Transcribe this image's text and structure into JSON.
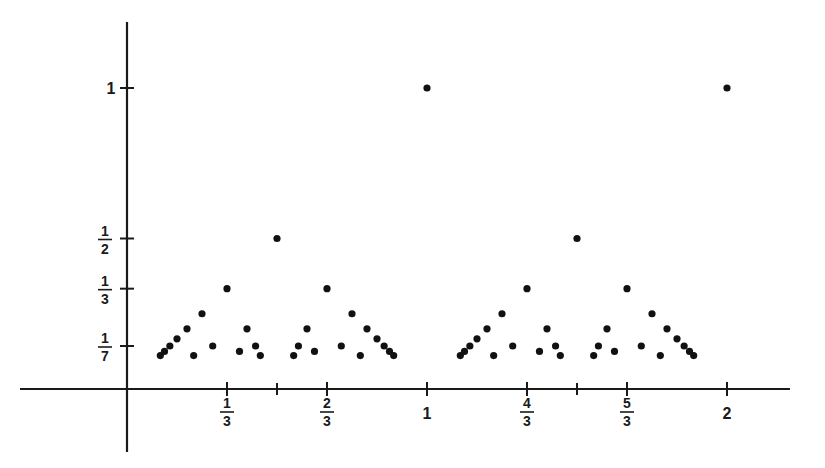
{
  "figure": {
    "title": "",
    "background_color": "#ffffff",
    "ink_color": "#1a1a1a",
    "dot_color": "#111111"
  },
  "geometry": {
    "origin_x_px": 127,
    "origin_y_px": 389,
    "px_per_unit_x": 300,
    "px_per_unit_y": 301,
    "dot_radius_px": 3.6,
    "x_axis_start_px": 20,
    "x_axis_end_px": 790,
    "y_axis_top_px": 22,
    "y_axis_bottom_px": 452,
    "tick_len_px": 7
  },
  "chart_data": {
    "type": "scatter",
    "title": "",
    "xlabel": "",
    "ylabel": "",
    "xlim": [
      -0.36,
      2.21
    ],
    "ylim": [
      -0.21,
      1.22
    ],
    "grid": false,
    "legend": null,
    "max_denominator": 9,
    "x_ticks": [
      {
        "value": 0.3333333333,
        "label": "1/3",
        "numerator": "1",
        "denominator": "3",
        "labeled": true
      },
      {
        "value": 0.5,
        "label": "",
        "labeled": false
      },
      {
        "value": 0.6666666667,
        "label": "2/3",
        "numerator": "2",
        "denominator": "3",
        "labeled": true
      },
      {
        "value": 1.0,
        "label": "1",
        "labeled": true
      },
      {
        "value": 1.3333333333,
        "label": "4/3",
        "numerator": "4",
        "denominator": "3",
        "labeled": true
      },
      {
        "value": 1.5,
        "label": "",
        "labeled": false
      },
      {
        "value": 1.6666666667,
        "label": "5/3",
        "numerator": "5",
        "denominator": "3",
        "labeled": true
      },
      {
        "value": 2.0,
        "label": "2",
        "labeled": true
      }
    ],
    "y_ticks": [
      {
        "value": 0.1428571429,
        "label": "1/7",
        "numerator": "1",
        "denominator": "7",
        "labeled": true
      },
      {
        "value": 0.3333333333,
        "label": "1/3",
        "numerator": "1",
        "denominator": "3",
        "labeled": true
      },
      {
        "value": 0.5,
        "label": "1/2",
        "numerator": "1",
        "denominator": "2",
        "labeled": true
      },
      {
        "value": 1.0,
        "label": "1",
        "labeled": true
      }
    ],
    "points": [
      {
        "x": 0.1111111111,
        "y": 0.1111111111
      },
      {
        "x": 0.125,
        "y": 0.125
      },
      {
        "x": 0.1428571429,
        "y": 0.1428571429
      },
      {
        "x": 0.1666666667,
        "y": 0.1666666667
      },
      {
        "x": 0.2,
        "y": 0.2
      },
      {
        "x": 0.2222222222,
        "y": 0.1111111111
      },
      {
        "x": 0.25,
        "y": 0.25
      },
      {
        "x": 0.2857142857,
        "y": 0.1428571429
      },
      {
        "x": 0.3333333333,
        "y": 0.3333333333
      },
      {
        "x": 0.375,
        "y": 0.125
      },
      {
        "x": 0.4,
        "y": 0.2
      },
      {
        "x": 0.4285714286,
        "y": 0.1428571429
      },
      {
        "x": 0.4444444444,
        "y": 0.1111111111
      },
      {
        "x": 0.5,
        "y": 0.5
      },
      {
        "x": 0.5555555556,
        "y": 0.1111111111
      },
      {
        "x": 0.5714285714,
        "y": 0.1428571429
      },
      {
        "x": 0.6,
        "y": 0.2
      },
      {
        "x": 0.625,
        "y": 0.125
      },
      {
        "x": 0.6666666667,
        "y": 0.3333333333
      },
      {
        "x": 0.7142857143,
        "y": 0.1428571429
      },
      {
        "x": 0.75,
        "y": 0.25
      },
      {
        "x": 0.7777777778,
        "y": 0.1111111111
      },
      {
        "x": 0.8,
        "y": 0.2
      },
      {
        "x": 0.8333333333,
        "y": 0.1666666667
      },
      {
        "x": 0.8571428571,
        "y": 0.1428571429
      },
      {
        "x": 0.875,
        "y": 0.125
      },
      {
        "x": 0.8888888889,
        "y": 0.1111111111
      },
      {
        "x": 1.0,
        "y": 1.0
      },
      {
        "x": 1.1111111111,
        "y": 0.1111111111
      },
      {
        "x": 1.125,
        "y": 0.125
      },
      {
        "x": 1.1428571429,
        "y": 0.1428571429
      },
      {
        "x": 1.1666666667,
        "y": 0.1666666667
      },
      {
        "x": 1.2,
        "y": 0.2
      },
      {
        "x": 1.2222222222,
        "y": 0.1111111111
      },
      {
        "x": 1.25,
        "y": 0.25
      },
      {
        "x": 1.2857142857,
        "y": 0.1428571429
      },
      {
        "x": 1.3333333333,
        "y": 0.3333333333
      },
      {
        "x": 1.375,
        "y": 0.125
      },
      {
        "x": 1.4,
        "y": 0.2
      },
      {
        "x": 1.4285714286,
        "y": 0.1428571429
      },
      {
        "x": 1.4444444444,
        "y": 0.1111111111
      },
      {
        "x": 1.5,
        "y": 0.5
      },
      {
        "x": 1.5555555556,
        "y": 0.1111111111
      },
      {
        "x": 1.5714285714,
        "y": 0.1428571429
      },
      {
        "x": 1.6,
        "y": 0.2
      },
      {
        "x": 1.625,
        "y": 0.125
      },
      {
        "x": 1.6666666667,
        "y": 0.3333333333
      },
      {
        "x": 1.7142857143,
        "y": 0.1428571429
      },
      {
        "x": 1.75,
        "y": 0.25
      },
      {
        "x": 1.7777777778,
        "y": 0.1111111111
      },
      {
        "x": 1.8,
        "y": 0.2
      },
      {
        "x": 1.8333333333,
        "y": 0.1666666667
      },
      {
        "x": 1.8571428571,
        "y": 0.1428571429
      },
      {
        "x": 1.875,
        "y": 0.125
      },
      {
        "x": 1.8888888889,
        "y": 0.1111111111
      },
      {
        "x": 2.0,
        "y": 1.0
      }
    ]
  }
}
